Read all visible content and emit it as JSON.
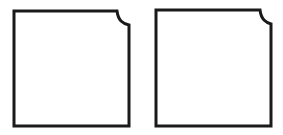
{
  "diagram": {
    "background": "#ffffff",
    "stroke_color": "#1a1a1a",
    "stroke_width": 3,
    "shapes": [
      {
        "id": "left-notched-square",
        "type": "notched-rectangle",
        "notch_corner": "top-right"
      },
      {
        "id": "right-notched-square",
        "type": "notched-rectangle",
        "notch_corner": "top-right"
      }
    ]
  }
}
